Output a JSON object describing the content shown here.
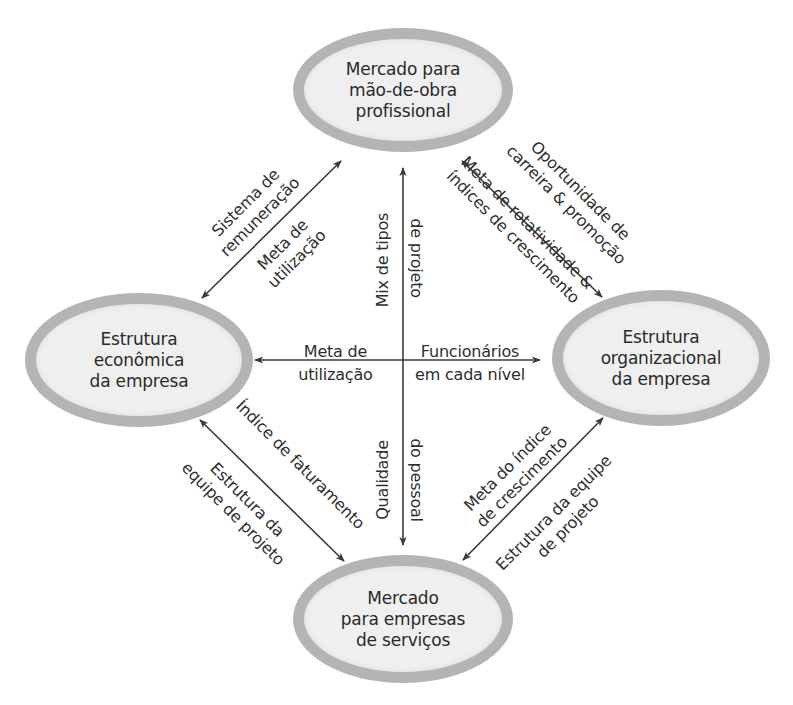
{
  "diagram": {
    "type": "relationship-diagram",
    "nodes": {
      "top": {
        "label": "Mercado para\nmão-de-obra\nprofissional"
      },
      "left": {
        "label": "Estrutura\neconômica\nda empresa"
      },
      "right": {
        "label": "Estrutura\norganizacional\nda empresa"
      },
      "bottom": {
        "label": "Mercado\npara empresas\nde serviços"
      }
    },
    "edges": {
      "top_left": {
        "outer_label": "Sistema de\nremuneração",
        "inner_label": "Meta de\nutilização",
        "direction": "bidirectional"
      },
      "top_right": {
        "outer_label": "Oportunidade de\ncarreira & promoção",
        "inner_label": "Meta de rotatividade &\níndices de crescimento",
        "direction": "bidirectional"
      },
      "vertical_upper": {
        "left_label": "Mix de tipos",
        "right_label": "de projeto",
        "direction": "to-top"
      },
      "vertical_lower": {
        "left_label": "Qualidade",
        "right_label": "do pessoal",
        "direction": "to-bottom"
      },
      "horizontal_left": {
        "label": "Meta de\nutilização",
        "direction": "to-left"
      },
      "horizontal_right": {
        "label": "Funcionários\nem cada nível",
        "direction": "to-right"
      },
      "left_bottom": {
        "outer_label": "Índice de faturamento",
        "inner_label": "Estrutura da\nequipe de projeto",
        "direction": "bidirectional"
      },
      "right_bottom": {
        "outer_label": "Meta do índice\nde crescimento",
        "inner_label": "Estrutura da equipe\nde projeto",
        "direction": "bidirectional"
      }
    },
    "colors": {
      "node_fill": "#efefef",
      "node_border": "#b4b4b4",
      "line": "#3a3a3a",
      "text": "#2a2a2a"
    }
  }
}
